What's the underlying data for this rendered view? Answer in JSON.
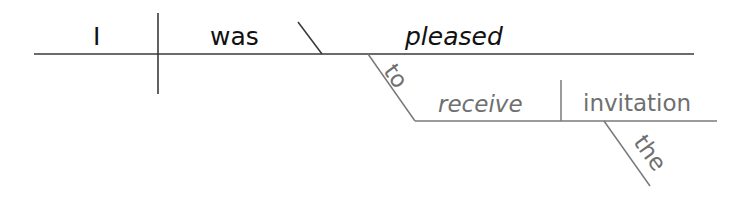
{
  "sentence": "I was pleased to receive the invitation",
  "diagram": {
    "subject": "I",
    "verb": "was",
    "predicate_adjective": "pleased",
    "infinitive_marker": "to",
    "infinitive_verb": "receive",
    "infinitive_object": "invitation",
    "article": "the"
  },
  "colors": {
    "main_lines": "#3a3a3a",
    "main_text": "#111111",
    "sub_lines": "#7a7a7a",
    "sub_text": "#6f6f6f"
  }
}
